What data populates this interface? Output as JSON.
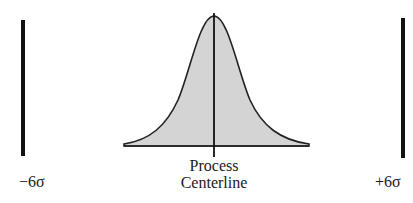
{
  "diagram": {
    "type": "six-sigma-distribution",
    "left_limit_label": "−6σ",
    "right_limit_label": "+6σ",
    "center_label_line1": "Process",
    "center_label_line2": "Centerline",
    "curve_fill_color": "#d4d4d4",
    "line_color": "#111111"
  }
}
